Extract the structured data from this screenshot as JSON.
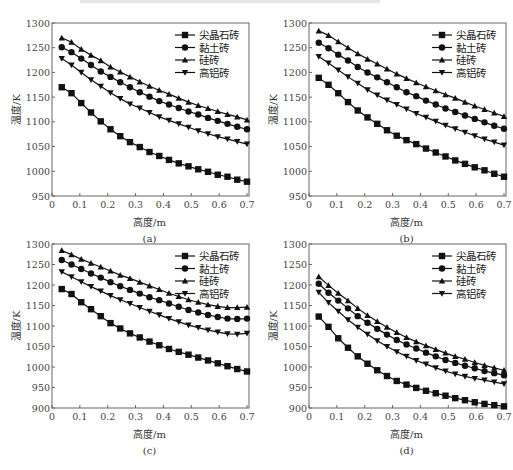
{
  "chart_data": [
    {
      "panel": "(a)",
      "type": "line",
      "xlabel": "高度/m",
      "ylabel": "温度/K",
      "xlim": [
        0,
        0.7
      ],
      "ylim": [
        950,
        1300
      ],
      "xticks": [
        0,
        0.1,
        0.2,
        0.3,
        0.4,
        0.5,
        0.6,
        0.7
      ],
      "yticks": [
        950,
        1000,
        1050,
        1100,
        1150,
        1200,
        1250,
        1300
      ],
      "legend_position": "upper right",
      "x": [
        0.035,
        0.07,
        0.105,
        0.14,
        0.175,
        0.21,
        0.245,
        0.28,
        0.315,
        0.35,
        0.385,
        0.42,
        0.455,
        0.49,
        0.525,
        0.56,
        0.595,
        0.63,
        0.665,
        0.7
      ],
      "series": [
        {
          "name": "尖晶石砖",
          "marker": "square",
          "values": [
            1170,
            1158,
            1138,
            1119,
            1101,
            1085,
            1071,
            1059,
            1049,
            1039,
            1031,
            1023,
            1016,
            1010,
            1004,
            999,
            993,
            989,
            983,
            979
          ]
        },
        {
          "name": "黏土砖",
          "marker": "circle",
          "values": [
            1251,
            1241,
            1228,
            1215,
            1202,
            1191,
            1180,
            1170,
            1160,
            1151,
            1142,
            1135,
            1128,
            1121,
            1115,
            1108,
            1102,
            1096,
            1090,
            1085
          ]
        },
        {
          "name": "硅砖",
          "marker": "triangle-up",
          "values": [
            1270,
            1261,
            1247,
            1235,
            1224,
            1211,
            1201,
            1191,
            1181,
            1172,
            1164,
            1156,
            1148,
            1140,
            1133,
            1127,
            1121,
            1115,
            1110,
            1104
          ]
        },
        {
          "name": "高铝砖",
          "marker": "triangle-down",
          "values": [
            1228,
            1215,
            1200,
            1185,
            1172,
            1159,
            1147,
            1136,
            1128,
            1119,
            1110,
            1103,
            1096,
            1089,
            1082,
            1076,
            1070,
            1065,
            1060,
            1055
          ]
        }
      ]
    },
    {
      "panel": "(b)",
      "type": "line",
      "xlabel": "高度/m",
      "ylabel": "温度/K",
      "xlim": [
        0,
        0.7
      ],
      "ylim": [
        950,
        1300
      ],
      "xticks": [
        0,
        0.1,
        0.2,
        0.3,
        0.4,
        0.5,
        0.6,
        0.7
      ],
      "yticks": [
        950,
        1000,
        1050,
        1100,
        1150,
        1200,
        1250,
        1300
      ],
      "legend_position": "upper right",
      "x": [
        0.035,
        0.07,
        0.105,
        0.14,
        0.175,
        0.21,
        0.245,
        0.28,
        0.315,
        0.35,
        0.385,
        0.42,
        0.455,
        0.49,
        0.525,
        0.56,
        0.595,
        0.63,
        0.665,
        0.7
      ],
      "series": [
        {
          "name": "尖晶石砖",
          "marker": "square",
          "values": [
            1189,
            1175,
            1158,
            1140,
            1123,
            1109,
            1096,
            1083,
            1072,
            1063,
            1055,
            1046,
            1038,
            1030,
            1022,
            1015,
            1008,
            1002,
            995,
            989
          ]
        },
        {
          "name": "黏土砖",
          "marker": "circle",
          "values": [
            1260,
            1249,
            1236,
            1224,
            1211,
            1200,
            1190,
            1180,
            1170,
            1160,
            1152,
            1143,
            1135,
            1127,
            1120,
            1113,
            1106,
            1099,
            1092,
            1086
          ]
        },
        {
          "name": "硅砖",
          "marker": "triangle-up",
          "values": [
            1284,
            1275,
            1262,
            1250,
            1238,
            1227,
            1217,
            1207,
            1197,
            1188,
            1179,
            1171,
            1163,
            1155,
            1148,
            1140,
            1132,
            1125,
            1118,
            1111
          ]
        },
        {
          "name": "高铝砖",
          "marker": "triangle-down",
          "values": [
            1232,
            1219,
            1205,
            1191,
            1178,
            1165,
            1154,
            1144,
            1135,
            1126,
            1117,
            1109,
            1101,
            1093,
            1086,
            1079,
            1072,
            1065,
            1059,
            1053
          ]
        }
      ]
    },
    {
      "panel": "(c)",
      "type": "line",
      "xlabel": "高度/m",
      "ylabel": "温度/K",
      "xlim": [
        0,
        0.7
      ],
      "ylim": [
        900,
        1300
      ],
      "xticks": [
        0,
        0.1,
        0.2,
        0.3,
        0.4,
        0.5,
        0.6,
        0.7
      ],
      "yticks": [
        900,
        950,
        1000,
        1050,
        1100,
        1150,
        1200,
        1250,
        1300
      ],
      "legend_position": "upper right",
      "x": [
        0.035,
        0.07,
        0.105,
        0.14,
        0.175,
        0.21,
        0.245,
        0.28,
        0.315,
        0.35,
        0.385,
        0.42,
        0.455,
        0.49,
        0.525,
        0.56,
        0.595,
        0.63,
        0.665,
        0.7
      ],
      "series": [
        {
          "name": "尖晶石砖",
          "marker": "square",
          "values": [
            1190,
            1178,
            1158,
            1141,
            1124,
            1107,
            1094,
            1082,
            1072,
            1062,
            1053,
            1044,
            1037,
            1030,
            1023,
            1016,
            1009,
            1002,
            995,
            989
          ]
        },
        {
          "name": "黏土砖",
          "marker": "circle",
          "values": [
            1261,
            1250,
            1239,
            1228,
            1218,
            1207,
            1197,
            1188,
            1179,
            1170,
            1163,
            1155,
            1147,
            1139,
            1133,
            1127,
            1122,
            1118,
            1117,
            1118
          ]
        },
        {
          "name": "硅砖",
          "marker": "triangle-up",
          "values": [
            1284,
            1274,
            1263,
            1253,
            1244,
            1234,
            1224,
            1216,
            1207,
            1198,
            1189,
            1180,
            1172,
            1164,
            1158,
            1152,
            1148,
            1145,
            1145,
            1146
          ]
        },
        {
          "name": "高铝砖",
          "marker": "triangle-down",
          "values": [
            1232,
            1220,
            1208,
            1196,
            1185,
            1174,
            1164,
            1155,
            1145,
            1136,
            1127,
            1118,
            1110,
            1102,
            1096,
            1090,
            1085,
            1081,
            1080,
            1082
          ]
        }
      ]
    },
    {
      "panel": "(d)",
      "type": "line",
      "xlabel": "高度/m",
      "ylabel": "温度/K",
      "xlim": [
        0,
        0.7
      ],
      "ylim": [
        900,
        1300
      ],
      "xticks": [
        0,
        0.1,
        0.2,
        0.3,
        0.4,
        0.5,
        0.6,
        0.7
      ],
      "yticks": [
        900,
        950,
        1000,
        1050,
        1100,
        1150,
        1200,
        1250,
        1300
      ],
      "legend_position": "upper right",
      "x": [
        0.035,
        0.07,
        0.105,
        0.14,
        0.175,
        0.21,
        0.245,
        0.28,
        0.315,
        0.35,
        0.385,
        0.42,
        0.455,
        0.49,
        0.525,
        0.56,
        0.595,
        0.63,
        0.665,
        0.7
      ],
      "series": [
        {
          "name": "尖晶石砖",
          "marker": "square",
          "values": [
            1123,
            1098,
            1070,
            1047,
            1026,
            1008,
            992,
            978,
            966,
            957,
            949,
            942,
            936,
            930,
            924,
            919,
            914,
            910,
            907,
            904
          ]
        },
        {
          "name": "黏土砖",
          "marker": "circle",
          "values": [
            1203,
            1181,
            1162,
            1143,
            1124,
            1108,
            1093,
            1079,
            1066,
            1055,
            1045,
            1035,
            1026,
            1017,
            1010,
            1003,
            997,
            990,
            985,
            980
          ]
        },
        {
          "name": "硅砖",
          "marker": "triangle-up",
          "values": [
            1220,
            1199,
            1180,
            1162,
            1143,
            1126,
            1111,
            1097,
            1084,
            1072,
            1062,
            1052,
            1043,
            1034,
            1026,
            1019,
            1011,
            1004,
            998,
            992
          ]
        },
        {
          "name": "高铝砖",
          "marker": "triangle-down",
          "values": [
            1182,
            1157,
            1136,
            1115,
            1097,
            1080,
            1064,
            1050,
            1037,
            1026,
            1016,
            1007,
            998,
            990,
            983,
            977,
            972,
            968,
            963,
            959
          ]
        }
      ]
    }
  ],
  "panels": [
    {
      "caption": "(a)"
    },
    {
      "caption": "(b)"
    },
    {
      "caption": "(c)"
    },
    {
      "caption": "(d)"
    }
  ]
}
